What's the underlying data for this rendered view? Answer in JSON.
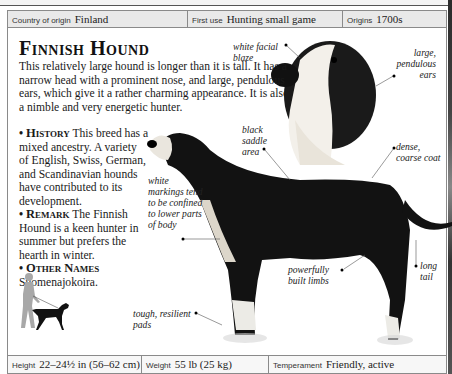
{
  "top_strip": {
    "partial_values": [
      "22–25 in (56–64 cm)",
      "44–55 lb (20–25 kg)",
      "Lively, cheerful"
    ]
  },
  "origin_bar": {
    "country": {
      "label": "Country of origin",
      "value": "Finland"
    },
    "first_use": {
      "label": "First use",
      "value": "Hunting small game"
    },
    "origins": {
      "label": "Origins",
      "value": "1700s"
    }
  },
  "breed": {
    "title": "Finnish Hound",
    "intro": "This relatively large hound is longer than it is tall. It has a narrow head with a prominent nose, and large, pendulous ears, which give it a rather charming appearance. It is also a nimble and very energetic hunter.",
    "sections": [
      {
        "heading": "History",
        "text": "This breed has a mixed ancestry. A variety of English, Swiss, German, and Scandinavian hounds have contributed to its development."
      },
      {
        "heading": "Remark",
        "text": "The Finnish Hound is a keen hunter in summer but prefers the hearth in winter."
      },
      {
        "heading": "Other Names",
        "text": "Suomenajokoira."
      }
    ]
  },
  "callouts": {
    "facial_blaze": "white facial blaze",
    "ears": "large, pendulous ears",
    "saddle": "black saddle area",
    "coat": "dense, coarse coat",
    "markings": "white markings tend to be confined to lower parts of body",
    "limbs": "powerfully built limbs",
    "tail": "long tail",
    "pads": "tough, resilient pads"
  },
  "stats_bar": {
    "height": {
      "label": "Height",
      "value": "22–24½ in (56–62 cm)"
    },
    "weight": {
      "label": "Weight",
      "value": "55 lb (25 kg)"
    },
    "temperament": {
      "label": "Temperament",
      "value": "Friendly, active"
    }
  },
  "colors": {
    "border": "#8a8a8a",
    "bar_bg": "#e9e9e9",
    "dog_black": "#111111",
    "walker_gray": "#a8a8a8"
  }
}
